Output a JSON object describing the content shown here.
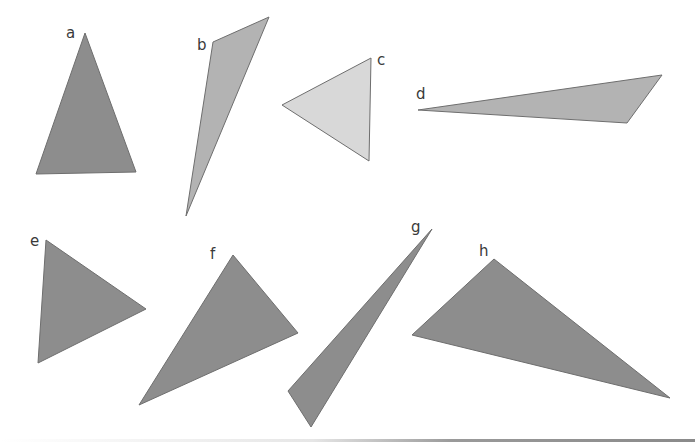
{
  "figure": {
    "colors": {
      "dark": "#8d8d8d",
      "medium": "#b3b3b3",
      "light": "#d8d8d8",
      "stroke": "#6e6e6e",
      "label": "#3a3a3a"
    },
    "triangles": [
      {
        "label": "a",
        "points": "85,33 136,172 36,174",
        "fill": "#8d8d8d",
        "label_x": 66,
        "label_y": 38
      },
      {
        "label": "b",
        "points": "213,42 269,17 186,216",
        "fill": "#b3b3b3",
        "label_x": 197,
        "label_y": 50
      },
      {
        "label": "c",
        "points": "371,58 369,161 282,105",
        "fill": "#d8d8d8",
        "label_x": 377,
        "label_y": 65
      },
      {
        "label": "d",
        "points": "418,110 662,75 627,123",
        "fill": "#b3b3b3",
        "label_x": 416,
        "label_y": 99
      },
      {
        "label": "e",
        "points": "46,240 146,309 38,363",
        "fill": "#8d8d8d",
        "label_x": 30,
        "label_y": 246
      },
      {
        "label": "f",
        "points": "233,255 298,333 139,405",
        "fill": "#8d8d8d",
        "label_x": 210,
        "label_y": 259
      },
      {
        "label": "g",
        "points": "432,229 311,427 288,391",
        "fill": "#8d8d8d",
        "label_x": 411,
        "label_y": 232
      },
      {
        "label": "h",
        "points": "494,259 670,398 412,335",
        "fill": "#8d8d8d",
        "label_x": 479,
        "label_y": 256
      }
    ]
  }
}
